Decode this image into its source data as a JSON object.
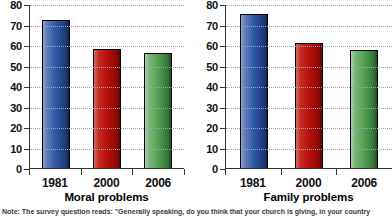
{
  "footnote": "Note: The survey question reads: \"Generally speaking, do you think that your church is giving, in your country",
  "colors": {
    "blue": "#2c52a0",
    "red": "#b50e08",
    "green": "#4f9c4d",
    "axis": "#333333",
    "gridline": "#9aa7bb"
  },
  "chart_data": [
    {
      "type": "bar",
      "title": "Moral problems",
      "xlabel": "",
      "ylabel": "",
      "categories": [
        "1981",
        "2000",
        "2006"
      ],
      "values": [
        72,
        58,
        56
      ],
      "bar_colors": [
        "blue",
        "red",
        "green"
      ],
      "ylim": [
        0,
        80
      ],
      "yticks": [
        0,
        10,
        20,
        30,
        40,
        50,
        60,
        70,
        80
      ],
      "ytick_labels": [
        "0",
        "10",
        "20",
        "30",
        "40",
        "50",
        "60",
        "70",
        "80"
      ],
      "grid": true,
      "legend": false
    },
    {
      "type": "bar",
      "title": "Family problems",
      "xlabel": "",
      "ylabel": "",
      "categories": [
        "1981",
        "2000",
        "2006"
      ],
      "values": [
        75,
        61,
        57.5
      ],
      "bar_colors": [
        "blue",
        "red",
        "green"
      ],
      "ylim": [
        0,
        80
      ],
      "yticks": [
        0,
        10,
        20,
        30,
        40,
        50,
        60,
        70,
        80
      ],
      "ytick_labels": [
        "0",
        "10",
        "20",
        "30",
        "40",
        "50",
        "60",
        "70",
        "80"
      ],
      "grid": true,
      "legend": false
    }
  ]
}
